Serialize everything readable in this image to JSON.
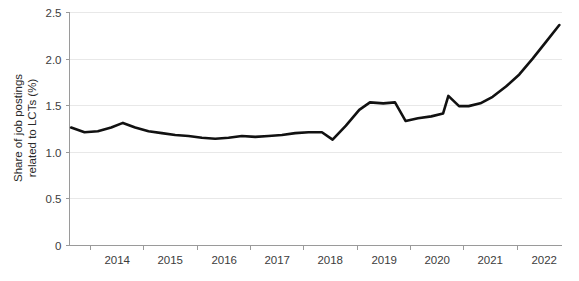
{
  "chart_data": {
    "type": "line",
    "title": "",
    "subtitle": "",
    "xlabel": "",
    "ylabel_line1": "Share of job postings",
    "ylabel_line2": "related to LCTs (%)",
    "ylabel": "Share of job postings related to LCTs (%)",
    "xlim": [
      2013.6,
      2022.85
    ],
    "ylim": [
      0,
      2.5
    ],
    "grid": true,
    "legend": false,
    "legend_position": "none",
    "line_color": "#111111",
    "grid_color": "#e8e8e8",
    "axis_color": "#9a9a9a",
    "background_color": "#ffffff",
    "y_ticks": [
      0,
      0.5,
      1.0,
      1.5,
      2.0,
      2.5
    ],
    "y_tick_labels": [
      "0",
      "0.5",
      "1.0",
      "1.5",
      "2.0",
      "2.5"
    ],
    "x_ticks": [
      2014,
      2015,
      2016,
      2017,
      2018,
      2019,
      2020,
      2021,
      2022
    ],
    "x_tick_labels": [
      "2014",
      "2015",
      "2016",
      "2017",
      "2018",
      "2019",
      "2020",
      "2021",
      "2022"
    ],
    "series": [
      {
        "name": "Share of job postings related to LCTs",
        "x": [
          2013.65,
          2013.9,
          2014.15,
          2014.4,
          2014.62,
          2014.85,
          2015.1,
          2015.35,
          2015.6,
          2015.85,
          2016.1,
          2016.35,
          2016.6,
          2016.85,
          2017.1,
          2017.35,
          2017.6,
          2017.85,
          2018.1,
          2018.35,
          2018.55,
          2018.8,
          2019.05,
          2019.25,
          2019.5,
          2019.72,
          2019.92,
          2020.15,
          2020.4,
          2020.62,
          2020.72,
          2020.92,
          2021.1,
          2021.32,
          2021.55,
          2021.8,
          2022.05,
          2022.3,
          2022.55,
          2022.8
        ],
        "y": [
          1.26,
          1.21,
          1.22,
          1.26,
          1.31,
          1.26,
          1.22,
          1.2,
          1.18,
          1.17,
          1.15,
          1.14,
          1.15,
          1.17,
          1.16,
          1.17,
          1.18,
          1.2,
          1.21,
          1.21,
          1.13,
          1.28,
          1.45,
          1.53,
          1.52,
          1.53,
          1.33,
          1.36,
          1.38,
          1.41,
          1.6,
          1.49,
          1.49,
          1.52,
          1.59,
          1.7,
          1.83,
          2.0,
          2.18,
          2.36
        ]
      }
    ],
    "annotations": []
  }
}
